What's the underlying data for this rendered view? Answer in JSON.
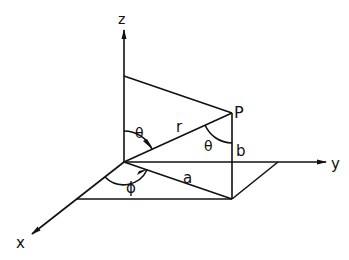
{
  "diagram": {
    "axes": {
      "x_label": "x",
      "y_label": "y",
      "z_label": "z"
    },
    "point_label": "P",
    "segment_labels": {
      "radius": "r",
      "horizontal_projection": "a",
      "vertical_height": "b"
    },
    "angle_labels": {
      "polar_at_origin": "θ",
      "polar_at_P": "θ",
      "azimuth": "ϕ"
    },
    "colors": {
      "line": "#111111",
      "background": "#ffffff"
    }
  }
}
